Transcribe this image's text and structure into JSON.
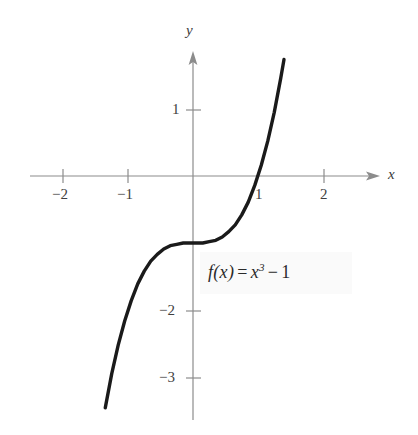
{
  "figure": {
    "background_color": "#ffffff",
    "axis_color": "#8c8c8c",
    "curve_color": "#1a1a1a",
    "text_color": "#3a3a3a"
  },
  "axes": {
    "x_label": "x",
    "y_label": "y",
    "x_ticks": [
      {
        "value": -2,
        "label": "−2"
      },
      {
        "value": -1,
        "label": "−1"
      },
      {
        "value": 1,
        "label": "1"
      },
      {
        "value": 2,
        "label": "2"
      }
    ],
    "y_ticks": [
      {
        "value": 1,
        "label": "1"
      },
      {
        "value": -2,
        "label": "−2"
      },
      {
        "value": -3,
        "label": "−3"
      }
    ]
  },
  "annotation": {
    "function_name": "f(x)",
    "equals": "=",
    "base": "x",
    "exponent": "3",
    "minus": "−",
    "constant": "1",
    "full_text": "f(x) = x³ − 1"
  },
  "chart_data": {
    "type": "line",
    "title": "",
    "xlabel": "x",
    "ylabel": "y",
    "xlim": [
      -2.5,
      2.85
    ],
    "ylim": [
      -3.85,
      1.75
    ],
    "grid": false,
    "legend": null,
    "annotations": [
      {
        "text": "f(x) = x³ − 1",
        "x": 0.25,
        "y": -1.4
      }
    ],
    "xticks": [
      -2,
      -1,
      1,
      2
    ],
    "xticklabels": [
      "−2",
      "−1",
      "1",
      "2"
    ],
    "yticks": [
      1,
      -2,
      -3
    ],
    "yticklabels": [
      "1",
      "−2",
      "−3"
    ],
    "series": [
      {
        "name": "f(x) = x³ − 1",
        "equation": "y = x^3 - 1",
        "color": "#1a1a1a",
        "x": [
          -1.35,
          -1.25,
          -1.15,
          -1.05,
          -0.95,
          -0.85,
          -0.75,
          -0.65,
          -0.55,
          -0.45,
          -0.35,
          -0.25,
          -0.15,
          -0.05,
          0.05,
          0.15,
          0.25,
          0.35,
          0.45,
          0.55,
          0.65,
          0.75,
          0.85,
          0.95,
          1.05,
          1.15,
          1.25,
          1.35,
          1.4
        ],
        "y": [
          -3.46,
          -2.95,
          -2.52,
          -2.16,
          -1.86,
          -1.61,
          -1.42,
          -1.27,
          -1.17,
          -1.09,
          -1.04,
          -1.02,
          -1.0,
          -1.0,
          -1.0,
          -1.0,
          -0.98,
          -0.96,
          -0.91,
          -0.83,
          -0.73,
          -0.58,
          -0.39,
          -0.14,
          0.16,
          0.52,
          0.95,
          1.46,
          1.74
        ]
      }
    ]
  }
}
